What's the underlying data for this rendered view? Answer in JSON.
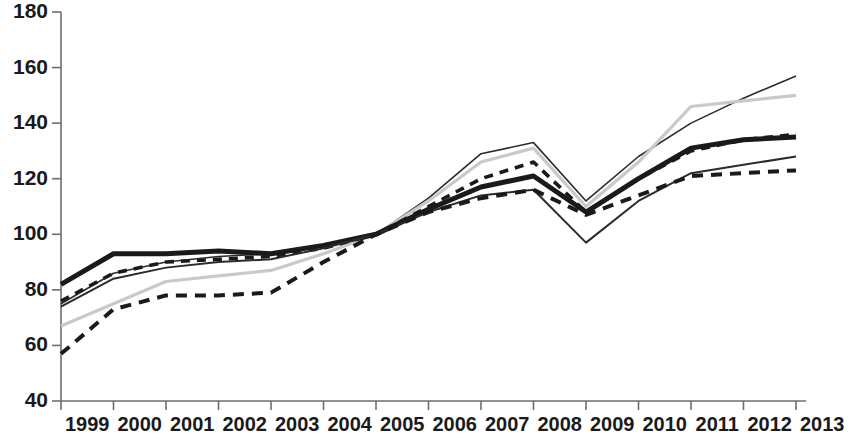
{
  "chart_data": {
    "type": "line",
    "title": "",
    "subtitle": "",
    "xlabel": "",
    "ylabel": "",
    "grid": false,
    "legend_position": "none",
    "x": [
      1999,
      2000,
      2001,
      2002,
      2003,
      2004,
      2005,
      2006,
      2007,
      2008,
      2009,
      2010,
      2011,
      2012,
      2013
    ],
    "categories": [
      "1999",
      "2000",
      "2001",
      "2002",
      "2003",
      "2004",
      "2005",
      "2006",
      "2007",
      "2008",
      "2009",
      "2010",
      "2011",
      "2012",
      "2013"
    ],
    "xlim": [
      1999,
      2013
    ],
    "ylim": [
      40,
      180
    ],
    "yticks": [
      40,
      60,
      80,
      100,
      120,
      140,
      160,
      180
    ],
    "xticks": [
      "1999",
      "2000",
      "2001",
      "2002",
      "2003",
      "2004",
      "2005",
      "2006",
      "2007",
      "2008",
      "2009",
      "2010",
      "2011",
      "2012",
      "2013"
    ],
    "series": [
      {
        "name": "series-1",
        "style": "solid-thin",
        "color": "#2b2b2b",
        "width": 1.6,
        "dash": "none",
        "values": [
          75,
          86,
          90,
          92,
          93,
          96,
          100,
          113,
          129,
          133,
          112,
          128,
          140,
          149,
          157
        ]
      },
      {
        "name": "series-2",
        "style": "solid-light-gray",
        "color": "#c9c9c9",
        "width": 3.2,
        "dash": "none",
        "values": [
          67,
          75,
          83,
          85,
          87,
          93,
          100,
          112,
          126,
          131,
          110,
          126,
          146,
          148,
          150
        ]
      },
      {
        "name": "series-3",
        "style": "solid-thick-black",
        "color": "#1a1a1a",
        "width": 5.0,
        "dash": "none",
        "values": [
          82,
          93,
          93,
          94,
          93,
          96,
          100,
          109,
          117,
          121,
          108,
          120,
          131,
          134,
          135
        ]
      },
      {
        "name": "series-4",
        "style": "dashed-black",
        "color": "#1a1a1a",
        "width": 3.6,
        "dash": "9,7",
        "values": [
          76,
          86,
          90,
          91,
          92,
          95,
          100,
          110,
          120,
          126,
          108,
          120,
          130,
          134,
          136
        ]
      },
      {
        "name": "series-5",
        "style": "solid-thin-dark",
        "color": "#2b2b2b",
        "width": 2.0,
        "dash": "none",
        "values": [
          74,
          84,
          88,
          90,
          91,
          95,
          100,
          108,
          114,
          116,
          97,
          112,
          122,
          125,
          128
        ]
      },
      {
        "name": "series-6",
        "style": "dashed-bold-black",
        "color": "#1a1a1a",
        "width": 4.0,
        "dash": "11,8",
        "values": [
          57,
          73,
          78,
          78,
          79,
          90,
          100,
          108,
          113,
          116,
          107,
          114,
          121,
          122,
          123
        ]
      }
    ]
  },
  "axes": {
    "y_labels": [
      "180",
      "160",
      "140",
      "120",
      "100",
      "80",
      "60",
      "40"
    ],
    "x_labels": [
      "1999",
      "2000",
      "2001",
      "2002",
      "2003",
      "2004",
      "2005",
      "2006",
      "2007",
      "2008",
      "2009",
      "2010",
      "2011",
      "2012",
      "2013"
    ],
    "axis_color": "#6e6e6e"
  }
}
